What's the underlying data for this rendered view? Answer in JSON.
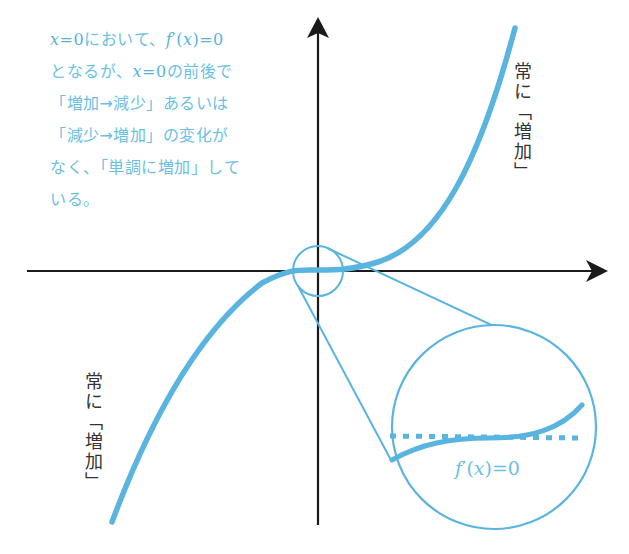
{
  "explanation": {
    "lines": [
      {
        "parts": [
          "x",
          "=0",
          "において、",
          "f",
          "′(",
          "x",
          ")=0"
        ]
      },
      {
        "text_a": "となるが、",
        "var": "x",
        "eq": "=0",
        "text_b": "の前後で"
      },
      {
        "text": "「増加→減少」あるいは"
      },
      {
        "text": "「減少→増加」の変化が"
      },
      {
        "text": "なく、「単調に増加」して"
      },
      {
        "text": "いる。"
      }
    ],
    "line1": {
      "var1": "x",
      "eq1": "=0",
      "text": "において、",
      "func": "f",
      "prime": "′",
      "open": "(",
      "var2": "x",
      "close_eq": ")=0"
    },
    "line2": {
      "text_a": "となるが、",
      "var": "x",
      "eq": "=0",
      "text_b": "の前後で"
    },
    "line3": "「増加→減少」あるいは",
    "line4": "「減少→増加」の変化が",
    "line5": "なく、「単調に増加」して",
    "line6": "いる。"
  },
  "labels": {
    "upper_right": "常に「増加」",
    "lower_left": "常に「増加」",
    "magnified_derivative": {
      "func": "f",
      "prime": "′",
      "open": "(",
      "var": "x",
      "close_eq": ")=0"
    }
  },
  "colors": {
    "curve": "#5ab4e0",
    "text_accent": "#6cbfe4",
    "axis": "#1a1a1a",
    "label": "#333333"
  },
  "diagram": {
    "type": "function-graph",
    "function": "monotonically increasing cubic with inflection at origin, f'(0)=0",
    "axes": {
      "horizontal_arrow": true,
      "vertical_arrow": true
    },
    "magnifier": {
      "small_circle_center": "origin",
      "shows": "horizontal tangent line (dotted) at x=0"
    }
  }
}
